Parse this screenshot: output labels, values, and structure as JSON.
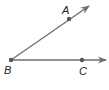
{
  "diagram": {
    "type": "angle",
    "colors": {
      "line": "#6e6e6e",
      "point": "#555555",
      "label": "#222222"
    },
    "points": [
      {
        "id": "B",
        "label": "B",
        "x": 11,
        "y": 60
      },
      {
        "id": "A",
        "label": "A",
        "x": 69,
        "y": 19
      },
      {
        "id": "C",
        "label": "C",
        "x": 82,
        "y": 60
      }
    ],
    "rays": [
      {
        "from": "B",
        "through": "A",
        "label": "ray-BA"
      },
      {
        "from": "B",
        "through": "C",
        "label": "ray-BC"
      }
    ],
    "labels": {
      "A": "A",
      "B": "B",
      "C": "C"
    }
  }
}
